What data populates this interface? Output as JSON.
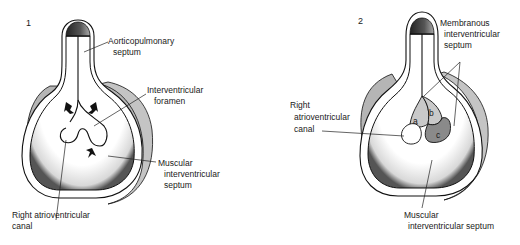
{
  "panels": [
    {
      "number": "1",
      "labels": {
        "aorticopulmonary_1": "Aorticopulmonary",
        "aorticopulmonary_2": "septum",
        "foramen_1": "Interventricular",
        "foramen_2": "foramen",
        "muscular_1": "Muscular",
        "muscular_2": "interventricular",
        "muscular_3": "septum",
        "rav_1": "Right atrioventricular",
        "rav_2": "canal"
      }
    },
    {
      "number": "2",
      "labels": {
        "membranous_1": "Membranous",
        "membranous_2": "interventricular",
        "membranous_3": "septum",
        "rav_1": "Right",
        "rav_2": "atrioventricular",
        "rav_3": "canal",
        "muscular_1": "Muscular",
        "muscular_2": "interventricular septum",
        "part_a": "a",
        "part_b": "b",
        "part_c": "c"
      }
    }
  ],
  "colors": {
    "shadow_gray": "#b5b5b5",
    "light_gray": "#c9c9c9",
    "dark_gray": "#8a8a8a",
    "outline": "#111111"
  }
}
